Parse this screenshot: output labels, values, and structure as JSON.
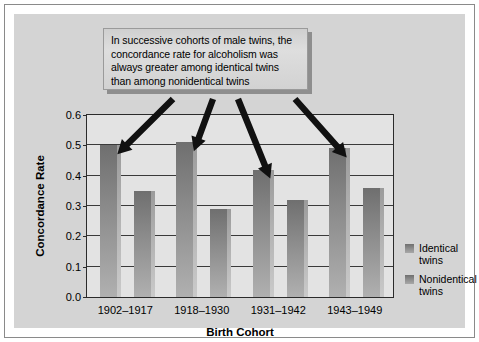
{
  "callout": {
    "text": "In successive cohorts of male twins, the\nconcordance rate for alcoholism was\nalways greater among identical twins\nthan among nonidentical twins"
  },
  "legend": {
    "items": [
      {
        "label": "Identical\ntwins",
        "color": "#8d8d8d"
      },
      {
        "label": "Nonidentical\ntwins",
        "color": "#8d8d8d"
      }
    ]
  },
  "axis": {
    "y_ticks": [
      "0.0",
      "0.1",
      "0.2",
      "0.3",
      "0.4",
      "0.5",
      "0.6"
    ],
    "y_title": "Concordance Rate",
    "x_title": "Birth Cohort"
  },
  "chart_data": {
    "type": "bar",
    "title": "",
    "subtitle": "",
    "xlabel": "Birth Cohort",
    "ylabel": "Concordance Rate",
    "ylim": [
      0.0,
      0.6
    ],
    "ytick_step": 0.1,
    "grid": true,
    "legend_position": "right",
    "categories": [
      "1902–1917",
      "1918–1930",
      "1931–1942",
      "1943–1949"
    ],
    "series": [
      {
        "name": "Identical twins",
        "values": [
          0.5,
          0.51,
          0.42,
          0.49
        ]
      },
      {
        "name": "Nonidentical twins",
        "values": [
          0.35,
          0.29,
          0.32,
          0.36
        ]
      }
    ],
    "annotations": [
      "In successive cohorts of male twins, the concordance rate for alcoholism was always greater among identical twins than among nonidentical twins"
    ]
  },
  "colors": {
    "plot_background": "#e3e3e3",
    "figure_background": "#d4d4d4",
    "bar": "#8d8d8d",
    "axis": "#2b2b2b",
    "arrow": "#111111"
  }
}
